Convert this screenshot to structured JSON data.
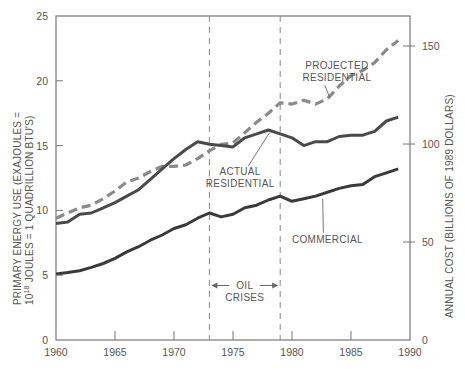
{
  "chart_data": {
    "type": "line",
    "title": "",
    "xlabel": "",
    "ylabel": "PRIMARY ENERGY USE (EXAJOULES = 10^18 JOULES = 1 QUADRILLION BTU'S)",
    "ylabel_line1": "PRIMARY ENERGY USE (EXAJOULES =",
    "ylabel_line2_base": "10",
    "ylabel_line2_sup": "18",
    "ylabel_line2_rest": " JOULES = 1 QUADRILLION BTU'S)",
    "y2label": "ANNUAL COST (BILLIONS OF 1989 DOLLARS)",
    "xlim": [
      1960,
      1990
    ],
    "ylim": [
      0,
      25
    ],
    "y2lim": [
      0,
      165
    ],
    "x_ticks": [
      1960,
      1965,
      1970,
      1975,
      1980,
      1985,
      1990
    ],
    "y_ticks": [
      0,
      5,
      10,
      15,
      20,
      25
    ],
    "y2_ticks": [
      0,
      50,
      100,
      150
    ],
    "grid": false,
    "legend_position": "inline annotations",
    "series": [
      {
        "name": "PROJECTED RESIDENTIAL",
        "style": "dashed",
        "color": "#8a8a8a",
        "x": [
          1960,
          1961,
          1962,
          1963,
          1964,
          1965,
          1966,
          1967,
          1968,
          1969,
          1970,
          1971,
          1972,
          1973,
          1974,
          1975,
          1976,
          1977,
          1978,
          1979,
          1980,
          1981,
          1982,
          1983,
          1984,
          1985,
          1986,
          1987,
          1988,
          1989
        ],
        "values": [
          9.4,
          9.8,
          10.2,
          10.4,
          10.9,
          11.5,
          12.2,
          12.5,
          13.0,
          13.4,
          13.4,
          13.5,
          14.0,
          14.6,
          15.1,
          15.2,
          16.0,
          16.8,
          17.5,
          18.3,
          18.2,
          18.5,
          18.2,
          18.6,
          19.6,
          20.4,
          20.8,
          21.4,
          22.4,
          23.1
        ]
      },
      {
        "name": "ACTUAL RESIDENTIAL",
        "style": "solid",
        "color": "#4a4a4a",
        "x": [
          1960,
          1961,
          1962,
          1963,
          1964,
          1965,
          1966,
          1967,
          1968,
          1969,
          1970,
          1971,
          1972,
          1973,
          1974,
          1975,
          1976,
          1977,
          1978,
          1979,
          1980,
          1981,
          1982,
          1983,
          1984,
          1985,
          1986,
          1987,
          1988,
          1989
        ],
        "values": [
          9.0,
          9.1,
          9.7,
          9.8,
          10.2,
          10.6,
          11.1,
          11.6,
          12.4,
          13.2,
          14.0,
          14.7,
          15.3,
          15.1,
          15.0,
          14.9,
          15.6,
          15.9,
          16.2,
          15.9,
          15.6,
          15.0,
          15.3,
          15.3,
          15.7,
          15.8,
          15.8,
          16.1,
          16.9,
          17.2
        ]
      },
      {
        "name": "COMMERCIAL",
        "style": "solid",
        "color": "#3a3a3a",
        "x": [
          1960,
          1961,
          1962,
          1963,
          1964,
          1965,
          1966,
          1967,
          1968,
          1969,
          1970,
          1971,
          1972,
          1973,
          1974,
          1975,
          1976,
          1977,
          1978,
          1979,
          1980,
          1981,
          1982,
          1983,
          1984,
          1985,
          1986,
          1987,
          1988,
          1989
        ],
        "values": [
          5.1,
          5.2,
          5.35,
          5.6,
          5.9,
          6.3,
          6.8,
          7.2,
          7.7,
          8.1,
          8.6,
          8.9,
          9.4,
          9.8,
          9.5,
          9.7,
          10.2,
          10.4,
          10.8,
          11.1,
          10.7,
          10.9,
          11.1,
          11.4,
          11.7,
          11.9,
          12.0,
          12.6,
          12.9,
          13.2
        ]
      }
    ],
    "annotations": [
      {
        "text_lines": [
          "PROJECTED",
          "RESIDENTIAL"
        ],
        "x": 1983.8,
        "y": 20.9,
        "leader_to": [
          1983.2,
          18.7
        ]
      },
      {
        "text_lines": [
          "ACTUAL",
          "RESIDENTIAL"
        ],
        "x": 1975.6,
        "y": 12.7,
        "leader_to": [
          1978.1,
          16.0
        ]
      },
      {
        "text_lines": [
          "COMMERCIAL"
        ],
        "x": 1983.0,
        "y": 7.5,
        "leader_to": [
          1982.6,
          10.9
        ]
      },
      {
        "text_lines": [
          "OIL",
          "CRISES"
        ],
        "x": 1976.0,
        "y": 3.9
      }
    ],
    "reference_lines": [
      {
        "x": 1973,
        "style": "dashed",
        "label": "oil crisis 1"
      },
      {
        "x": 1979,
        "style": "dashed",
        "label": "oil crisis 2"
      }
    ]
  }
}
